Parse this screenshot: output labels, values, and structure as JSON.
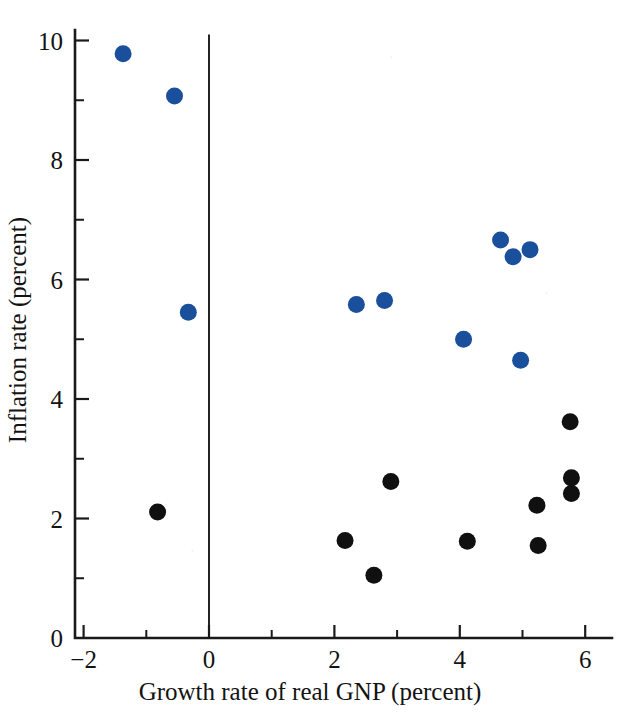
{
  "chart_data": {
    "type": "scatter",
    "title": "",
    "xlabel": "Growth rate of real GNP (percent)",
    "ylabel": "Inflation rate (percent)",
    "xlim": [
      -2.1,
      6.6
    ],
    "ylim": [
      0,
      10.6
    ],
    "xticks": [
      -2,
      0,
      2,
      4,
      6
    ],
    "xtick_labels": [
      "−2",
      "0",
      "2",
      "4",
      "6"
    ],
    "x_minor_ticks": [
      -1,
      1,
      3,
      5
    ],
    "yticks": [
      0,
      2,
      4,
      6,
      8,
      10
    ],
    "ytick_labels": [
      "0",
      "2",
      "4",
      "6",
      "8",
      "10"
    ],
    "y_minor_ticks": [
      1,
      3,
      5,
      7,
      9
    ],
    "grid": false,
    "legend": "none",
    "annotations": [
      {
        "name": "zero-reference-line",
        "type": "vline",
        "x": 0,
        "y_from": 0,
        "y_to": 10.1
      }
    ],
    "series": [
      {
        "name": "blue-points",
        "color": "#1a4f9c",
        "marker": "filled-circle",
        "marker_radius_px": 8.5,
        "points": [
          {
            "x": -1.37,
            "y": 9.78
          },
          {
            "x": -0.55,
            "y": 9.07
          },
          {
            "x": -0.33,
            "y": 5.45
          },
          {
            "x": 2.35,
            "y": 5.58
          },
          {
            "x": 2.8,
            "y": 5.65
          },
          {
            "x": 4.06,
            "y": 5.0
          },
          {
            "x": 4.65,
            "y": 6.66
          },
          {
            "x": 4.85,
            "y": 6.38
          },
          {
            "x": 5.12,
            "y": 6.5
          },
          {
            "x": 4.97,
            "y": 4.65
          }
        ]
      },
      {
        "name": "black-points",
        "color": "#101010",
        "marker": "filled-circle",
        "marker_radius_px": 8.5,
        "points": [
          {
            "x": -0.82,
            "y": 2.11
          },
          {
            "x": 2.17,
            "y": 1.63
          },
          {
            "x": 2.63,
            "y": 1.05
          },
          {
            "x": 2.9,
            "y": 2.62
          },
          {
            "x": 4.12,
            "y": 1.62
          },
          {
            "x": 5.23,
            "y": 2.22
          },
          {
            "x": 5.25,
            "y": 1.55
          },
          {
            "x": 5.76,
            "y": 3.62
          },
          {
            "x": 5.78,
            "y": 2.68
          },
          {
            "x": 5.78,
            "y": 2.42
          }
        ]
      }
    ],
    "geometry": {
      "x0_px": 209,
      "x_unit_px": 62.7,
      "y0_px": 638,
      "y_unit_px": 59.75,
      "axis_left_px": 75,
      "axis_right_px": 612,
      "axis_top_px": 30
    }
  }
}
